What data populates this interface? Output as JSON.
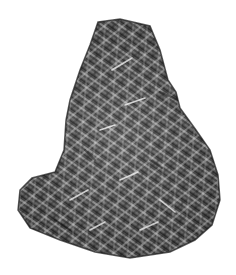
{
  "image": {
    "subject": "meteorite slice with Widmanstätten pattern",
    "background_color": "#ffffff",
    "specimen": {
      "base_color": "#4a4a4a",
      "dark_edge_color": "#1c1c1c",
      "highlight_color": "#e8e8e8",
      "outline_points": "98,22 120,19 150,26 160,50 168,80 176,92 180,108 196,130 210,150 218,175 220,200 212,225 195,240 170,252 130,258 95,252 60,240 30,228 18,210 20,190 32,178 55,172 64,150 66,120 70,100 80,70 90,45"
    }
  }
}
